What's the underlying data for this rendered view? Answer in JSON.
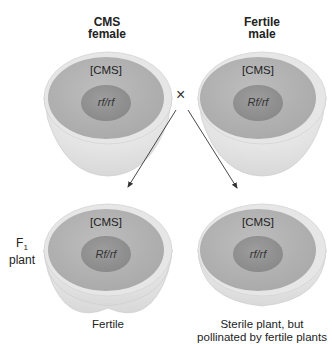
{
  "parents": {
    "female": {
      "title_line1": "CMS",
      "title_line2": "female",
      "cytoplasm": "[CMS]",
      "nucleus": "rf/rf"
    },
    "male": {
      "title_line1": "Fertile",
      "title_line2": "male",
      "cytoplasm": "[CMS]",
      "nucleus": "Rf/rf"
    }
  },
  "cross_symbol": "×",
  "f1_label": {
    "line1": "F",
    "subscript": "1",
    "line2": "plant"
  },
  "offspring": {
    "left": {
      "cytoplasm": "[CMS]",
      "nucleus": "Rf/rf",
      "caption_line1": "Fertile",
      "caption_line2": ""
    },
    "right": {
      "cytoplasm": "[CMS]",
      "nucleus": "rf/rf",
      "caption_line1": "Sterile plant, but",
      "caption_line2": "pollinated by fertile plants"
    }
  },
  "colors": {
    "cytoplasm": "#b3b3b3",
    "nucleus": "#959595",
    "rim": "#e4e4e4",
    "bowl": "#ececec",
    "arrow": "#333333"
  }
}
